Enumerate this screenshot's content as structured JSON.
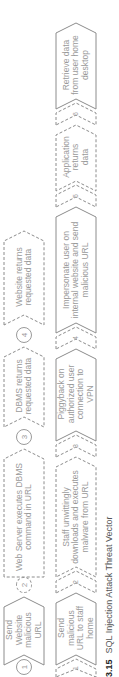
{
  "figure": {
    "caption_number": "3.15",
    "caption_text": "SQL Injection Attack Threat Vector"
  },
  "top_row": {
    "steps": [
      {
        "num": "1",
        "label": "Send Website malicious URL",
        "style": "solid"
      },
      {
        "num": "2",
        "label": "Web Server executes DBMS command in URL",
        "style": "dashed"
      },
      {
        "num": "3",
        "label": "DBMS returns requested data",
        "style": "dashed"
      },
      {
        "num": "4",
        "label": "Website returns requested data",
        "style": "dashed"
      }
    ]
  },
  "bottom_row": {
    "steps": [
      {
        "num": "1",
        "label": "Send malicious URL to staff home",
        "style": "solid"
      },
      {
        "num": "2",
        "label": "Staff unwittingly downloads and executes malware from URL",
        "style": "dashed"
      },
      {
        "num": "3",
        "label": "Piggyback on authorized user connection to VPN",
        "style": "solid"
      },
      {
        "num": "4",
        "label": "Impersonate user on internal website and send malicious URL",
        "style": "solid"
      },
      {
        "num": "5",
        "label": "Application returns data",
        "style": "dashed"
      },
      {
        "num": "6",
        "label": "Retrieve data from user home desktop",
        "style": "solid"
      }
    ]
  },
  "colors": {
    "stroke": "#8c8c8c",
    "text": "#9a9a9a",
    "caption": "#333333"
  }
}
